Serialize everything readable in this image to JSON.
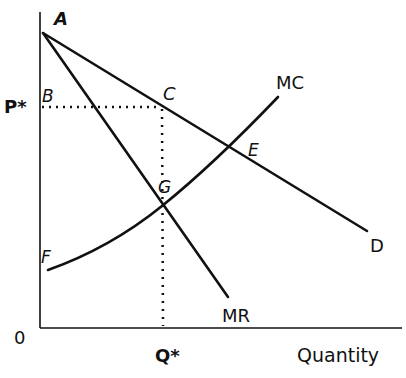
{
  "diagram": {
    "type": "economics-monopoly",
    "axes": {
      "origin_label": "0",
      "x_label": "Quantity",
      "y_tick_label": "P*",
      "x_tick_label": "Q*"
    },
    "curves": {
      "demand": "D",
      "marginal_revenue": "MR",
      "marginal_cost": "MC"
    },
    "points": {
      "A": "A",
      "B": "B",
      "C": "C",
      "E": "E",
      "F": "F",
      "G": "G"
    },
    "colors": {
      "line": "#111111",
      "background": "#ffffff"
    }
  }
}
